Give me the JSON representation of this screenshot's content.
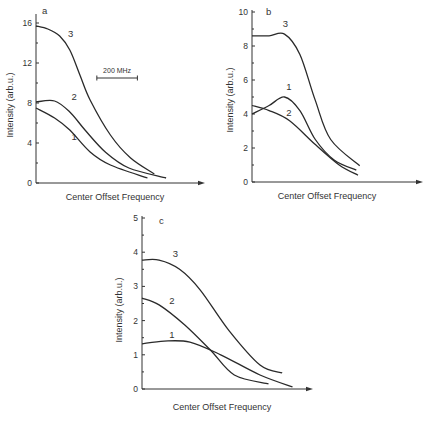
{
  "chart_data": [
    {
      "type": "line",
      "panel": "a",
      "title": "",
      "xlabel": "Center Offset Frequency",
      "ylabel": "Intensity (arb.u.)",
      "xlim": [
        0,
        1
      ],
      "ylim": [
        0,
        16
      ],
      "yticks": [
        0,
        4,
        8,
        12,
        16
      ],
      "x_units": "fraction of axis length (no ticks shown)",
      "grid": false,
      "legend": "none",
      "annotations": [
        {
          "type": "scale_bar",
          "label": "200 MHz",
          "x_span": [
            0.36,
            0.6
          ],
          "y": 10.5
        }
      ],
      "series": [
        {
          "name": "3",
          "x": [
            0,
            0.07,
            0.14,
            0.2,
            0.26,
            0.32,
            0.44,
            0.56,
            0.7
          ],
          "y": [
            15.7,
            15.4,
            14.7,
            13.3,
            10.8,
            8.3,
            4.8,
            2.5,
            0.9
          ],
          "label_at": [
            0.19,
            14.6
          ]
        },
        {
          "name": "2",
          "x": [
            0,
            0.11,
            0.2,
            0.29,
            0.41,
            0.55,
            0.77
          ],
          "y": [
            8.1,
            8.2,
            7.1,
            5.3,
            3.1,
            1.5,
            0.5
          ],
          "label_at": [
            0.21,
            8.3
          ]
        },
        {
          "name": "1",
          "x": [
            0,
            0.11,
            0.2,
            0.32,
            0.44,
            0.66
          ],
          "y": [
            7.5,
            6.5,
            5.3,
            3.1,
            1.8,
            0.5
          ],
          "label_at": [
            0.21,
            4.3
          ]
        }
      ]
    },
    {
      "type": "line",
      "panel": "b",
      "title": "",
      "xlabel": "Center Offset Frequency",
      "ylabel": "Intensity (arb.u.)",
      "xlim": [
        0,
        1
      ],
      "ylim": [
        0,
        10
      ],
      "yticks": [
        0,
        2,
        4,
        6,
        8,
        10
      ],
      "x_units": "fraction of axis length (no ticks shown)",
      "grid": false,
      "legend": "none",
      "series": [
        {
          "name": "3",
          "x": [
            0,
            0.1,
            0.19,
            0.28,
            0.37,
            0.46,
            0.63
          ],
          "y": [
            8.6,
            8.6,
            8.7,
            7.5,
            4.8,
            2.5,
            0.95
          ],
          "label_at": [
            0.18,
            9.1
          ]
        },
        {
          "name": "1",
          "x": [
            0,
            0.1,
            0.19,
            0.28,
            0.37,
            0.48,
            0.61
          ],
          "y": [
            4.0,
            4.5,
            5.0,
            4.2,
            2.5,
            1.3,
            0.7
          ],
          "label_at": [
            0.2,
            5.4
          ]
        },
        {
          "name": "2",
          "x": [
            0,
            0.1,
            0.22,
            0.37,
            0.51,
            0.62
          ],
          "y": [
            4.5,
            4.2,
            3.6,
            2.2,
            1.0,
            0.4
          ],
          "label_at": [
            0.2,
            3.9
          ]
        }
      ]
    },
    {
      "type": "line",
      "panel": "c",
      "title": "",
      "xlabel": "Center Offset Frequency",
      "ylabel": "Intensity (arb.u.)",
      "xlim": [
        0,
        1
      ],
      "ylim": [
        0,
        5
      ],
      "yticks": [
        0,
        1,
        2,
        3,
        4,
        5
      ],
      "x_units": "fraction of axis length (no ticks shown)",
      "grid": false,
      "legend": "none",
      "series": [
        {
          "name": "3",
          "x": [
            0,
            0.1,
            0.22,
            0.34,
            0.51,
            0.69,
            0.82
          ],
          "y": [
            3.77,
            3.77,
            3.5,
            2.9,
            1.7,
            0.7,
            0.47
          ],
          "label_at": [
            0.18,
            3.85
          ]
        },
        {
          "name": "2",
          "x": [
            0,
            0.1,
            0.25,
            0.4,
            0.54,
            0.74
          ],
          "y": [
            2.66,
            2.46,
            1.87,
            1.14,
            0.41,
            0.15
          ],
          "label_at": [
            0.16,
            2.5
          ]
        },
        {
          "name": "1",
          "x": [
            0,
            0.13,
            0.28,
            0.46,
            0.69,
            0.88
          ],
          "y": [
            1.32,
            1.4,
            1.37,
            1.0,
            0.41,
            0.06
          ],
          "label_at": [
            0.16,
            1.5
          ]
        }
      ]
    }
  ]
}
